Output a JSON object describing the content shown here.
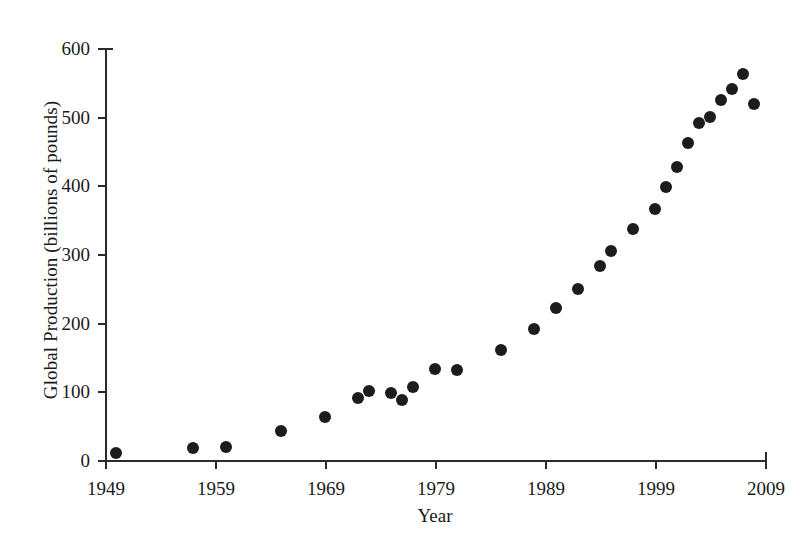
{
  "chart_data": {
    "type": "scatter",
    "title": "",
    "xlabel": "Year",
    "ylabel": "Global Production (billions of pounds)",
    "xlim": [
      1949,
      2009
    ],
    "ylim": [
      0,
      600
    ],
    "xticks": [
      1949,
      1959,
      1969,
      1979,
      1989,
      1999,
      2009
    ],
    "yticks": [
      0,
      100,
      200,
      300,
      400,
      500,
      600
    ],
    "xtick_labels": [
      "1949",
      "1959",
      "1969",
      "1979",
      "1989",
      "1999",
      "2009"
    ],
    "ytick_labels": [
      "0",
      "100",
      "200",
      "300",
      "400",
      "500",
      "600"
    ],
    "grid": false,
    "legend": null,
    "marker": {
      "shape": "circle",
      "color": "#1c1c1c",
      "size": 12
    },
    "x": [
      1950,
      1957,
      1960,
      1965,
      1969,
      1972,
      1973,
      1975,
      1976,
      1977,
      1979,
      1981,
      1985,
      1988,
      1990,
      1992,
      1994,
      1995,
      1997,
      1999,
      2000,
      2001,
      2002,
      2003,
      2004,
      2005,
      2006,
      2007
    ],
    "values": [
      10,
      17,
      19,
      42,
      62,
      90,
      101,
      98,
      87,
      107,
      132,
      131,
      160,
      191,
      222,
      249,
      283,
      305,
      337,
      366,
      397,
      427,
      461,
      491,
      500,
      525,
      541,
      562
    ],
    "points": [
      {
        "x": 1950,
        "y": 10
      },
      {
        "x": 1957,
        "y": 17
      },
      {
        "x": 1960,
        "y": 19
      },
      {
        "x": 1965,
        "y": 42
      },
      {
        "x": 1969,
        "y": 62
      },
      {
        "x": 1972,
        "y": 90
      },
      {
        "x": 1973,
        "y": 101
      },
      {
        "x": 1975,
        "y": 98
      },
      {
        "x": 1976,
        "y": 87
      },
      {
        "x": 1977,
        "y": 107
      },
      {
        "x": 1979,
        "y": 132
      },
      {
        "x": 1981,
        "y": 131
      },
      {
        "x": 1985,
        "y": 160
      },
      {
        "x": 1988,
        "y": 191
      },
      {
        "x": 1990,
        "y": 222
      },
      {
        "x": 1992,
        "y": 249
      },
      {
        "x": 1994,
        "y": 283
      },
      {
        "x": 1995,
        "y": 305
      },
      {
        "x": 1997,
        "y": 337
      },
      {
        "x": 1999,
        "y": 366
      },
      {
        "x": 2000,
        "y": 397
      },
      {
        "x": 2001,
        "y": 427
      },
      {
        "x": 2002,
        "y": 461
      },
      {
        "x": 2003,
        "y": 491
      },
      {
        "x": 2004,
        "y": 500
      },
      {
        "x": 2005,
        "y": 525
      },
      {
        "x": 2006,
        "y": 541
      },
      {
        "x": 2007,
        "y": 562
      },
      {
        "x": 2008,
        "y": 519
      }
    ]
  },
  "colors": {
    "marker": "#1c1c1c",
    "axis": "#2b2b2b",
    "text": "#1a1a1a",
    "background": "#ffffff"
  }
}
